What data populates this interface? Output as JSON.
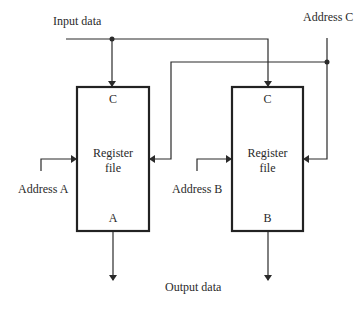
{
  "labels": {
    "input_data": "Input data",
    "address_c": "Address C",
    "address_a": "Address A",
    "address_b": "Address B",
    "output_data": "Output data"
  },
  "register_files": [
    {
      "top_port": "C",
      "title_line1": "Register",
      "title_line2": "file",
      "bottom_port": "A"
    },
    {
      "top_port": "C",
      "title_line1": "Register",
      "title_line2": "file",
      "bottom_port": "B"
    }
  ],
  "colors": {
    "line": "#2a2a2a",
    "box": "#222222"
  }
}
